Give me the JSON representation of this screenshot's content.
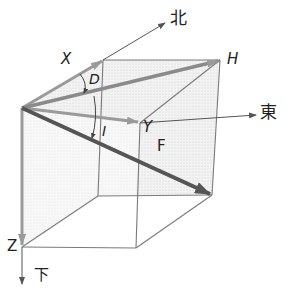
{
  "diagram": {
    "type": "geomagnetic-field-components",
    "axes": {
      "north": "北",
      "east": "東",
      "down": "下"
    },
    "components": {
      "X": "X",
      "Y": "Y",
      "Z": "Z",
      "H": "H",
      "F": "F"
    },
    "angles": {
      "declination": "D",
      "inclination": "I"
    },
    "colors": {
      "outline": "#7a7a7a",
      "axis": "#555555",
      "component_arrow": "#9a9a9a",
      "total_field_arrow": "#555555",
      "shading": "#e6e6e6"
    }
  }
}
